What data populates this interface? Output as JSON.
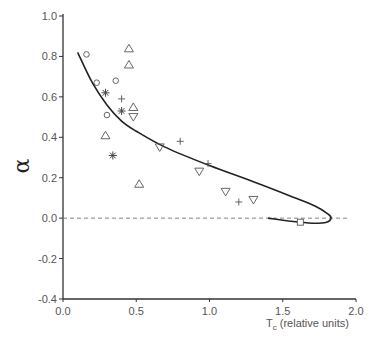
{
  "chart_data": {
    "type": "scatter",
    "title": "",
    "xlabel": "T",
    "xlabel_sub": "c",
    "xlabel_suffix": " (relative units)",
    "ylabel": "α",
    "xlim": [
      0.0,
      2.0
    ],
    "ylim": [
      -0.4,
      1.0
    ],
    "x_ticks": [
      "0.0",
      "0.5",
      "1.0",
      "1.5",
      "2.0"
    ],
    "y_ticks": [
      "1.0",
      "0.8",
      "0.6",
      "0.4",
      "0.2",
      "0.0",
      "-0.2",
      "-0.4"
    ],
    "grid": false,
    "reference_line": {
      "y": 0.0,
      "style": "dashed"
    },
    "series": [
      {
        "name": "circles",
        "marker": "circle",
        "points": [
          [
            0.16,
            0.81
          ],
          [
            0.23,
            0.67
          ],
          [
            0.36,
            0.68
          ],
          [
            0.3,
            0.51
          ]
        ]
      },
      {
        "name": "triangles-up",
        "marker": "triangle-up",
        "points": [
          [
            0.45,
            0.84
          ],
          [
            0.45,
            0.76
          ],
          [
            0.48,
            0.55
          ],
          [
            0.29,
            0.41
          ],
          [
            0.52,
            0.17
          ]
        ]
      },
      {
        "name": "triangles-down",
        "marker": "triangle-down",
        "points": [
          [
            0.48,
            0.5
          ],
          [
            0.66,
            0.35
          ],
          [
            0.93,
            0.23
          ],
          [
            1.11,
            0.13
          ],
          [
            1.3,
            0.09
          ]
        ]
      },
      {
        "name": "asterisks",
        "marker": "asterisk",
        "points": [
          [
            0.29,
            0.62
          ],
          [
            0.4,
            0.53
          ],
          [
            0.34,
            0.31
          ]
        ]
      },
      {
        "name": "plus",
        "marker": "plus",
        "points": [
          [
            0.4,
            0.59
          ],
          [
            0.8,
            0.38
          ],
          [
            0.99,
            0.27
          ],
          [
            1.2,
            0.08
          ]
        ]
      },
      {
        "name": "square",
        "marker": "square",
        "points": [
          [
            1.62,
            -0.02
          ]
        ]
      }
    ],
    "curve": {
      "name": "fit",
      "points": [
        [
          0.1,
          0.82
        ],
        [
          0.2,
          0.67
        ],
        [
          0.3,
          0.56
        ],
        [
          0.4,
          0.48
        ],
        [
          0.5,
          0.43
        ],
        [
          0.7,
          0.35
        ],
        [
          1.0,
          0.26
        ],
        [
          1.3,
          0.18
        ],
        [
          1.55,
          0.11
        ],
        [
          1.72,
          0.06
        ],
        [
          1.81,
          0.02
        ],
        [
          1.83,
          0.0
        ],
        [
          1.8,
          -0.02
        ],
        [
          1.7,
          -0.025
        ],
        [
          1.55,
          -0.015
        ],
        [
          1.4,
          0.0
        ]
      ]
    }
  }
}
